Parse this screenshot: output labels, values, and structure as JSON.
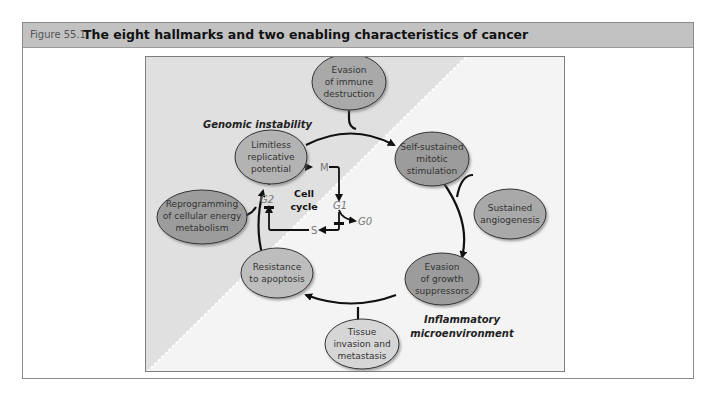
{
  "figure": {
    "number": "Figure 55.1",
    "title": "The eight hallmarks and two enabling characteristics of cancer"
  },
  "regions": {
    "top_left": "Genomic instability",
    "bottom_right_line1": "Inflammatory",
    "bottom_right_line2": "microenvironment"
  },
  "hallmarks": [
    {
      "id": "immune",
      "lines": [
        "Evasion",
        "of immune",
        "destruction"
      ],
      "fill": "#a9a9a9"
    },
    {
      "id": "mitotic",
      "lines": [
        "Self-sustained",
        "mitotic",
        "stimulation"
      ],
      "fill": "#9c9c9c"
    },
    {
      "id": "angiogenesis",
      "lines": [
        "Sustained",
        "angiogenesis"
      ],
      "fill": "#a9a9a9"
    },
    {
      "id": "growth",
      "lines": [
        "Evasion",
        "of growth",
        "suppressors"
      ],
      "fill": "#9c9c9c"
    },
    {
      "id": "invasion",
      "lines": [
        "Tissue",
        "invasion and",
        "metastasis"
      ],
      "fill": "#d6d6d6"
    },
    {
      "id": "apoptosis",
      "lines": [
        "Resistance",
        "to apoptosis"
      ],
      "fill": "#bdbdbd"
    },
    {
      "id": "metabolism",
      "lines": [
        "Reprogramming",
        "of cellular energy",
        "metabolism"
      ],
      "fill": "#9c9c9c"
    },
    {
      "id": "replicative",
      "lines": [
        "Limitless",
        "replicative",
        "potential"
      ],
      "fill": "#b3b3b3"
    }
  ],
  "cell_cycle": {
    "center_line1": "Cell",
    "center_line2": "cycle",
    "phases": {
      "M": "M",
      "G1": "G1",
      "G0": "G0",
      "S": "S",
      "G2": "G2"
    }
  },
  "colors": {
    "header_bg": "#c2c2c2",
    "diagram_light": "#f4f4f4",
    "diagram_dark": "#e2e2e2",
    "arrow": "#111111"
  }
}
